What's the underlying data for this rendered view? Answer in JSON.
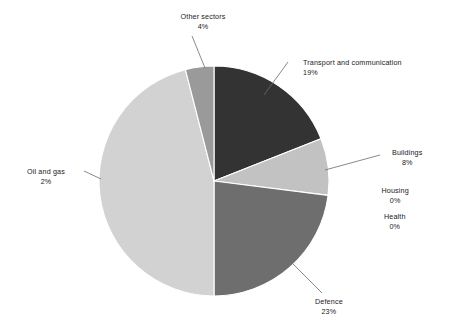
{
  "chart_data": {
    "type": "pie",
    "title": "",
    "subtitle": "",
    "xlabel": "",
    "ylabel": "",
    "legend_position": "none",
    "grid": false,
    "units": "percent",
    "total_label": "100%",
    "categories": [
      "Transport and communication",
      "Buildings",
      "Housing",
      "Health",
      "Defence",
      "Oil and gas",
      "Other sectors"
    ],
    "values": [
      19,
      8,
      0,
      0,
      23,
      2,
      4
    ],
    "slices": [
      {
        "label": "Transport and communication",
        "value": 19,
        "value_text": "19%",
        "color": "#333333",
        "start_angle": 0.0,
        "end_angle": 68.4,
        "label_align": "left",
        "label_x": 303,
        "label_y": 58,
        "leader": true
      },
      {
        "label": "Buildings",
        "value": 8,
        "value_text": "8%",
        "color": "#c2c2c2",
        "start_angle": 68.4,
        "end_angle": 97.2,
        "label_align": "center",
        "label_x": 407,
        "label_y": 148,
        "leader": true
      },
      {
        "label": "Housing",
        "value": 0,
        "value_text": "0%",
        "color": "#c2c2c2",
        "start_angle": 97.2,
        "end_angle": 97.2,
        "label_align": "center",
        "label_x": 395,
        "label_y": 186,
        "leader": false
      },
      {
        "label": "Health",
        "value": 0,
        "value_text": "0%",
        "color": "#c2c2c2",
        "start_angle": 97.2,
        "end_angle": 97.2,
        "label_align": "center",
        "label_x": 395,
        "label_y": 212,
        "leader": false
      },
      {
        "label": "Defence",
        "value": 23,
        "value_text": "23%",
        "color": "#6e6e6e",
        "start_angle": 97.2,
        "end_angle": 180.0,
        "label_align": "center",
        "label_x": 329,
        "label_y": 297,
        "leader": true
      },
      {
        "label": "Oil and gas",
        "value": 2,
        "value_text": "2%",
        "color": "#d2d2d2",
        "start_angle": 180.0,
        "end_angle": 345.6,
        "label_align": "center",
        "label_x": 46,
        "label_y": 167,
        "leader": true
      },
      {
        "label": "Other sectors",
        "value": 4,
        "value_text": "4%",
        "color": "#9a9a9a",
        "start_angle": 345.6,
        "end_angle": 360.0,
        "label_align": "center",
        "label_x": 203,
        "label_y": 12,
        "leader": true
      }
    ],
    "geometry": {
      "center_x": 214,
      "center_y": 181,
      "radius": 115,
      "start_at": "12-o-clock",
      "direction": "clockwise",
      "slice_border_color": "#ffffff",
      "slice_border_width": 1.1
    },
    "background_color": "#ffffff",
    "leader_color": "#6b6b6b"
  }
}
